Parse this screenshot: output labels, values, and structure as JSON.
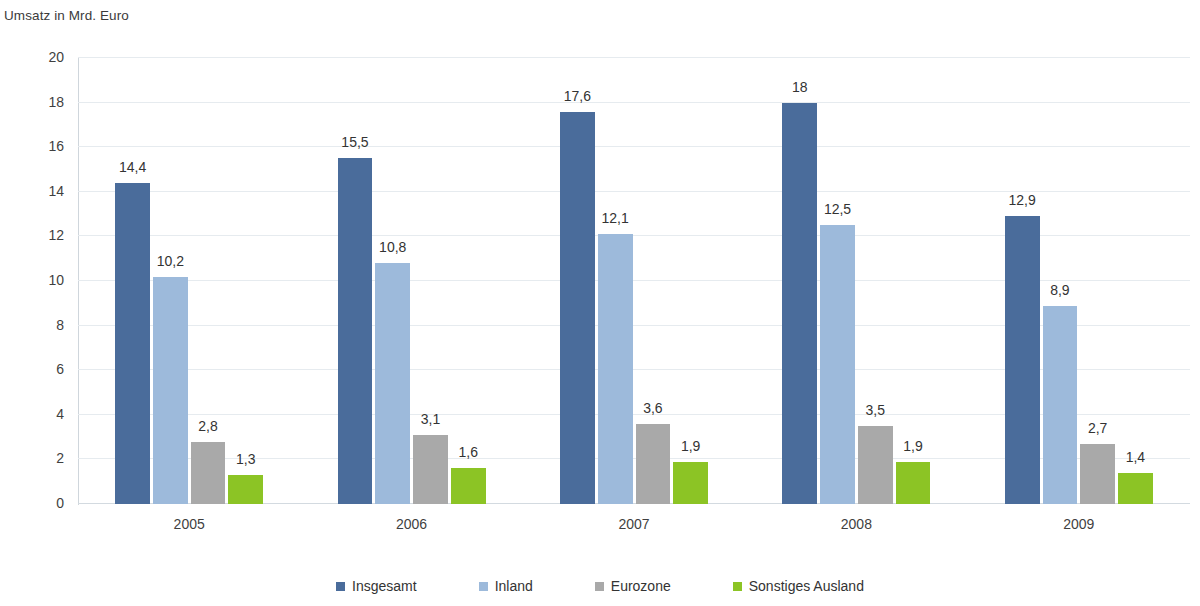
{
  "chart_data": {
    "type": "bar",
    "title": "Umsatz in Mrd. Euro",
    "xlabel": "",
    "ylabel": "Umsatz in Mrd. Euro",
    "ylim": [
      0,
      20
    ],
    "ytick_step": 2,
    "grid": true,
    "legend_position": "bottom",
    "categories": [
      "2005",
      "2006",
      "2007",
      "2008",
      "2009"
    ],
    "ytick_labels": [
      "20",
      "18",
      "16",
      "14",
      "12",
      "10",
      "8",
      "6",
      "4",
      "2",
      "0"
    ],
    "series": [
      {
        "name": "Insgesamt",
        "color": "#4a6c9b",
        "values": [
          14.4,
          15.5,
          17.6,
          18,
          12.9
        ],
        "labels": [
          "14,4",
          "15,5",
          "17,6",
          "18",
          "12,9"
        ]
      },
      {
        "name": "Inland",
        "color": "#9dbadb",
        "values": [
          10.2,
          10.8,
          12.1,
          12.5,
          8.9
        ],
        "labels": [
          "10,2",
          "10,8",
          "12,1",
          "12,5",
          "8,9"
        ]
      },
      {
        "name": "Eurozone",
        "color": "#a9a9a9",
        "values": [
          2.8,
          3.1,
          3.6,
          3.5,
          2.7
        ],
        "labels": [
          "2,8",
          "3,1",
          "3,6",
          "3,5",
          "2,7"
        ]
      },
      {
        "name": "Sonstiges Ausland",
        "color": "#8cc425",
        "values": [
          1.3,
          1.6,
          1.9,
          1.9,
          1.4
        ],
        "labels": [
          "1,3",
          "1,6",
          "1,9",
          "1,9",
          "1,4"
        ]
      }
    ]
  },
  "axis": {
    "y_title": "Umsatz in Mrd. Euro"
  },
  "legend": {
    "items": [
      {
        "label": "Insgesamt",
        "color": "#4a6c9b"
      },
      {
        "label": "Inland",
        "color": "#9dbadb"
      },
      {
        "label": "Eurozone",
        "color": "#a9a9a9"
      },
      {
        "label": "Sonstiges Ausland",
        "color": "#8cc425"
      }
    ]
  }
}
